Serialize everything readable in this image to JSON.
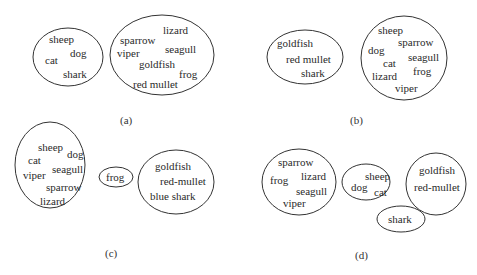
{
  "panels": [
    {
      "label": "(a)",
      "label_pos": [
        120,
        115
      ],
      "groups": [
        {
          "ellipse": [
            68,
            57,
            35,
            29
          ],
          "items": [
            {
              "text": "sheep",
              "x": 49,
              "y": 34
            },
            {
              "text": "dog",
              "x": 70,
              "y": 48
            },
            {
              "text": "cat",
              "x": 45,
              "y": 55
            },
            {
              "text": "shark",
              "x": 63,
              "y": 69
            }
          ]
        },
        {
          "ellipse": [
            162,
            55,
            52,
            40
          ],
          "items": [
            {
              "text": "lizard",
              "x": 163,
              "y": 25
            },
            {
              "text": "sparrow",
              "x": 120,
              "y": 35
            },
            {
              "text": "seagull",
              "x": 165,
              "y": 44
            },
            {
              "text": "viper",
              "x": 117,
              "y": 48
            },
            {
              "text": "goldfish",
              "x": 139,
              "y": 59
            },
            {
              "text": "frog",
              "x": 179,
              "y": 69
            },
            {
              "text": "red mullet",
              "x": 133,
              "y": 79
            }
          ]
        }
      ]
    },
    {
      "label": "(b)",
      "label_pos": [
        350,
        115
      ],
      "groups": [
        {
          "ellipse": [
            305,
            57,
            38,
            27
          ],
          "items": [
            {
              "text": "goldfish",
              "x": 277,
              "y": 38
            },
            {
              "text": "red mullet",
              "x": 286,
              "y": 54
            },
            {
              "text": "shark",
              "x": 301,
              "y": 68
            }
          ]
        },
        {
          "ellipse": [
            404,
            58,
            43,
            42
          ],
          "items": [
            {
              "text": "sheep",
              "x": 378,
              "y": 25
            },
            {
              "text": "sparrow",
              "x": 398,
              "y": 37
            },
            {
              "text": "dog",
              "x": 368,
              "y": 45
            },
            {
              "text": "seagull",
              "x": 408,
              "y": 52
            },
            {
              "text": "cat",
              "x": 383,
              "y": 58
            },
            {
              "text": "frog",
              "x": 413,
              "y": 66
            },
            {
              "text": "lizard",
              "x": 372,
              "y": 71
            },
            {
              "text": "viper",
              "x": 395,
              "y": 83
            }
          ]
        }
      ]
    },
    {
      "label": "(c)",
      "label_pos": [
        105,
        248
      ],
      "groups": [
        {
          "ellipse": [
            50,
            165,
            35,
            43
          ],
          "items": [
            {
              "text": "sheep",
              "x": 38,
              "y": 142
            },
            {
              "text": "dog",
              "x": 67,
              "y": 149
            },
            {
              "text": "cat",
              "x": 28,
              "y": 155
            },
            {
              "text": "seagull",
              "x": 52,
              "y": 164
            },
            {
              "text": "viper",
              "x": 23,
              "y": 170
            },
            {
              "text": "sparrow",
              "x": 46,
              "y": 182
            },
            {
              "text": "lizard",
              "x": 40,
              "y": 196
            }
          ]
        },
        {
          "ellipse": [
            116,
            177,
            17,
            10
          ],
          "items": [
            {
              "text": "frog",
              "x": 106,
              "y": 172
            }
          ]
        },
        {
          "ellipse": [
            176,
            182,
            38,
            32
          ],
          "items": [
            {
              "text": "goldfish",
              "x": 155,
              "y": 161
            },
            {
              "text": "red-mullet",
              "x": 160,
              "y": 176
            },
            {
              "text": "blue shark",
              "x": 150,
              "y": 191
            }
          ]
        }
      ]
    },
    {
      "label": "(d)",
      "label_pos": [
        355,
        250
      ],
      "groups": [
        {
          "ellipse": [
            299,
            182,
            37,
            33
          ],
          "items": [
            {
              "text": "sparrow",
              "x": 278,
              "y": 157
            },
            {
              "text": "frog",
              "x": 270,
              "y": 175
            },
            {
              "text": "lizard",
              "x": 301,
              "y": 171
            },
            {
              "text": "seagull",
              "x": 296,
              "y": 186
            },
            {
              "text": "viper",
              "x": 283,
              "y": 198
            }
          ]
        },
        {
          "ellipse": [
            366,
            182,
            24,
            18
          ],
          "items": [
            {
              "text": "sheep",
              "x": 365,
              "y": 171
            },
            {
              "text": "dog",
              "x": 351,
              "y": 182
            },
            {
              "text": "cat",
              "x": 374,
              "y": 187
            }
          ]
        },
        {
          "ellipse": [
            436,
            184,
            30,
            31
          ],
          "items": [
            {
              "text": "goldfish",
              "x": 419,
              "y": 165
            },
            {
              "text": "red-mullet",
              "x": 414,
              "y": 182
            }
          ]
        },
        {
          "ellipse": [
            401,
            219,
            24,
            13
          ],
          "items": [
            {
              "text": "shark",
              "x": 388,
              "y": 214
            }
          ]
        }
      ]
    }
  ]
}
